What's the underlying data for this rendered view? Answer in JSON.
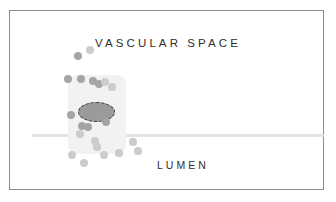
{
  "figure": {
    "width": 336,
    "height": 202,
    "background_color": "#ffffff",
    "frame": {
      "border_color": "#8d8d92",
      "fill_color": "#ffffff"
    }
  },
  "labels": {
    "vascular_space": "VASCULAR SPACE",
    "lumen": "LUMEN",
    "text_color": "#2e2e2e"
  },
  "diagram_elements": {
    "membrane_line": {
      "name": "membrane-line",
      "color": "#e4e4e4"
    },
    "cell_body": {
      "name": "cell-body",
      "color": "#f2f2f2"
    },
    "cell_nucleus": {
      "name": "cell-nucleus",
      "fill_color": "#9b9b9b",
      "outline_color": "#3a3a3a",
      "outline_style": "dashed"
    },
    "particle_colors": {
      "default": "#b9b9b9",
      "dark": "#a5a5a5",
      "light": "#cccccc"
    }
  },
  "particles": [
    {
      "x": 78,
      "y": 56,
      "r": 4.0,
      "tone": "dark"
    },
    {
      "x": 90,
      "y": 50,
      "r": 4.0,
      "tone": "light"
    },
    {
      "x": 68,
      "y": 79,
      "r": 4.2,
      "tone": "dark"
    },
    {
      "x": 81,
      "y": 79,
      "r": 4.2,
      "tone": "dark"
    },
    {
      "x": 93,
      "y": 81,
      "r": 4.0,
      "tone": "dark"
    },
    {
      "x": 99,
      "y": 84,
      "r": 4.0,
      "tone": "dark"
    },
    {
      "x": 105,
      "y": 82,
      "r": 4.0,
      "tone": "light"
    },
    {
      "x": 112,
      "y": 87,
      "r": 3.6,
      "tone": "light"
    },
    {
      "x": 71,
      "y": 115,
      "r": 4.2,
      "tone": "dark"
    },
    {
      "x": 82,
      "y": 126,
      "r": 4.0,
      "tone": "dark"
    },
    {
      "x": 88,
      "y": 127,
      "r": 4.0,
      "tone": "dark"
    },
    {
      "x": 106,
      "y": 122,
      "r": 4.0,
      "tone": "dark"
    },
    {
      "x": 80,
      "y": 134,
      "r": 3.6,
      "tone": "light"
    },
    {
      "x": 95,
      "y": 141,
      "r": 4.0,
      "tone": "light"
    },
    {
      "x": 97,
      "y": 147,
      "r": 3.6,
      "tone": "light"
    },
    {
      "x": 133,
      "y": 142,
      "r": 3.6,
      "tone": "light"
    },
    {
      "x": 72,
      "y": 155,
      "r": 4.0,
      "tone": "light"
    },
    {
      "x": 84,
      "y": 163,
      "r": 4.0,
      "tone": "light"
    },
    {
      "x": 104,
      "y": 155,
      "r": 4.0,
      "tone": "light"
    },
    {
      "x": 119,
      "y": 153,
      "r": 3.6,
      "tone": "light"
    },
    {
      "x": 138,
      "y": 151,
      "r": 3.6,
      "tone": "light"
    }
  ]
}
